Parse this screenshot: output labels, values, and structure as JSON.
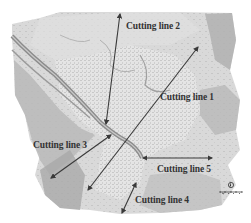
{
  "map": {
    "type": "grayscale topographic terrain map with settlement",
    "background": "#ffffff",
    "terrain_colors": [
      "#e8e8e8",
      "#d4d4d4",
      "#bdbdbd",
      "#a8a8a8",
      "#8f8f8f"
    ],
    "arrow_color": "#3a3a3a"
  },
  "cutting_lines": [
    {
      "id": 1,
      "label": "Cutting line 1",
      "x1": 198,
      "y1": 47,
      "x2": 88,
      "y2": 190,
      "label_x": 160,
      "label_y": 92
    },
    {
      "id": 2,
      "label": "Cutting line 2",
      "x1": 120,
      "y1": 14,
      "x2": 106,
      "y2": 124,
      "label_x": 126,
      "label_y": 21
    },
    {
      "id": 3,
      "label": "Cutting line 3",
      "x1": 111,
      "y1": 135,
      "x2": 51,
      "y2": 178,
      "label_x": 33,
      "label_y": 140
    },
    {
      "id": 4,
      "label": "Cutting line 4",
      "x1": 136,
      "y1": 183,
      "x2": 122,
      "y2": 213,
      "label_x": 135,
      "label_y": 195
    },
    {
      "id": 5,
      "label": "Cutting line 5",
      "x1": 143,
      "y1": 158,
      "x2": 212,
      "y2": 158,
      "label_x": 157,
      "label_y": 164
    }
  ],
  "legend": {
    "north_arrow": "north-arrow-icon",
    "scale_bar": "scale-bar-icon"
  }
}
